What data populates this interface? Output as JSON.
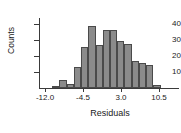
{
  "chart_data": {
    "type": "bar",
    "title": "",
    "subtitle": "",
    "xlabel": "Residuals",
    "ylabel": "Counts",
    "grid": false,
    "legend": false,
    "legend_position": "none",
    "bar_fill_color": "#8b8b8b",
    "bar_border_color": "#4a4a4a",
    "axis_color": "#3a3a3a",
    "xlim": [
      -13.5,
      13.5
    ],
    "ylim": [
      0,
      44
    ],
    "bin_width": 1.5,
    "xticks": [
      -12.0,
      -4.5,
      3.0,
      10.5
    ],
    "xtick_labels": [
      "-12.0",
      "-4.5",
      "3.0",
      "10.5"
    ],
    "yticks": [
      10,
      20,
      30,
      40
    ],
    "ytick_labels": [
      "10",
      "20",
      "30",
      "40"
    ],
    "bin_starts": [
      -12.0,
      -10.5,
      -9.0,
      -7.5,
      -6.0,
      -4.5,
      -3.0,
      -1.5,
      0.0,
      1.5,
      3.0,
      4.5,
      6.0,
      7.5,
      9.0
    ],
    "bin_ends": [
      -10.5,
      -9.0,
      -7.5,
      -6.0,
      -4.5,
      -3.0,
      -1.5,
      0.0,
      1.5,
      3.0,
      4.5,
      6.0,
      7.5,
      9.0,
      10.5
    ],
    "categories": [
      "-12.0 to -10.5",
      "-10.5 to -9.0",
      "-9.0 to -7.5",
      "-7.5 to -6.0",
      "-6.0 to -4.5",
      "-4.5 to -3.0",
      "-3.0 to -1.5",
      "-1.5 to 0.0",
      "0.0 to 1.5",
      "1.5 to 3.0",
      "3.0 to 4.5",
      "4.5 to 6.0",
      "6.0 to 7.5",
      "7.5 to 9.0",
      "9.0 to 10.5"
    ],
    "values": [
      1,
      4,
      2,
      11,
      22,
      33,
      23,
      31,
      31,
      25,
      23.5,
      14.5,
      13,
      12,
      1.5
    ]
  }
}
